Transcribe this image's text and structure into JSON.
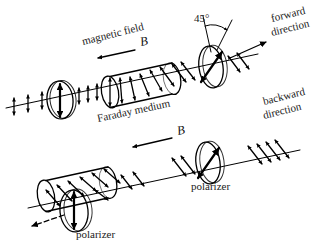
{
  "figure": {
    "background_color": "#ffffff",
    "ink_color": "#000000",
    "label_color": "#1a1a1a"
  },
  "labels": {
    "magnetic_field": "magnetic field",
    "b_field_top": "B",
    "b_field_bottom": "B",
    "angle": "45°",
    "forward_line1": "forward",
    "forward_line2": "direction",
    "backward_line1": "backward",
    "backward_line2": "direction",
    "faraday_medium": "Faraday medium",
    "polarizer_top": "polarizer",
    "polarizer_bottom": "polarizer"
  },
  "diagram_top": {
    "name": "forward-pass",
    "description": "Light travels left to right through polarizer, Faraday medium under field B, then 45-degree analyzer and exits",
    "beam_angle_deg": -12,
    "components": [
      {
        "name": "input-polarization-marks",
        "kind": "polarization-ticks",
        "orientation": "vertical"
      },
      {
        "name": "first-polarizer",
        "kind": "polarizer-disk",
        "transmission_axis": "vertical"
      },
      {
        "name": "faraday-medium-cylinder",
        "kind": "cylinder",
        "field_direction": "leftward"
      },
      {
        "name": "rotated-polarization-marks",
        "kind": "polarization-ticks",
        "orientation": "45deg"
      },
      {
        "name": "second-polarizer",
        "kind": "polarizer-disk",
        "transmission_axis": "45deg"
      },
      {
        "name": "output-beam-arrow",
        "kind": "arrow",
        "direction": "forward"
      }
    ]
  },
  "diagram_bottom": {
    "name": "backward-pass",
    "description": "Light travelling right to left is rotated a further 45 degrees and blocked by the vertical polarizer",
    "beam_angle_deg": -12,
    "components": [
      {
        "name": "backward-input-marks",
        "kind": "polarization-ticks",
        "orientation": "45deg"
      },
      {
        "name": "analyzer-polarizer",
        "kind": "polarizer-disk",
        "transmission_axis": "45deg"
      },
      {
        "name": "faraday-medium-cylinder",
        "kind": "cylinder",
        "field_direction": "leftward"
      },
      {
        "name": "output-polarizer",
        "kind": "polarizer-disk",
        "transmission_axis": "vertical"
      },
      {
        "name": "blocked-beam-arrow",
        "kind": "arrow",
        "direction": "backward"
      }
    ]
  }
}
